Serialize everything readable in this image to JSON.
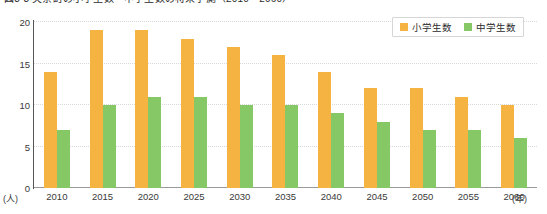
{
  "chart_data": {
    "type": "bar",
    "title": "図3-3 矢祭町の小学生数・中学生数の将来予測（2010～2060）",
    "xlabel": "(年)",
    "ylabel": "(人)",
    "ylim": [
      0,
      20
    ],
    "yticks": [
      0,
      5,
      10,
      15,
      20
    ],
    "grid": true,
    "legend_position": "top-right",
    "categories": [
      "2010",
      "2015",
      "2020",
      "2025",
      "2030",
      "2035",
      "2040",
      "2045",
      "2050",
      "2055",
      "2060"
    ],
    "series": [
      {
        "name": "小学生数",
        "color": "#f5b342",
        "values": [
          14,
          19,
          19,
          18,
          17,
          16,
          14,
          12,
          12,
          11,
          10
        ]
      },
      {
        "name": "中学生数",
        "color": "#86c766",
        "values": [
          7,
          10,
          11,
          11,
          10,
          10,
          9,
          8,
          7,
          7,
          6
        ]
      }
    ]
  },
  "axis": {
    "y_unit": "(人)",
    "x_unit": "(年)"
  }
}
